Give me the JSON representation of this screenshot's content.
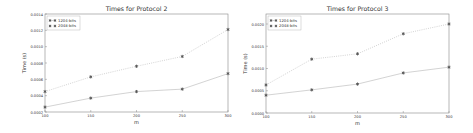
{
  "chart_data": [
    {
      "type": "line",
      "title": "Times for Protocol 2",
      "xlabel": "m",
      "ylabel": "Time (s)",
      "x": [
        100,
        150,
        200,
        250,
        300
      ],
      "xticks": [
        "100",
        "150",
        "200",
        "250",
        "300"
      ],
      "ylim": [
        0.0002,
        0.0014
      ],
      "yticks": [
        0.0002,
        0.0004,
        0.0006,
        0.0008,
        0.001,
        0.0012,
        0.0014
      ],
      "ytick_labels": [
        "0.0002",
        "0.0004",
        "0.0006",
        "0.0008",
        "0.0010",
        "0.0012",
        "0.0014"
      ],
      "grid": false,
      "legend_position": "upper left",
      "series": [
        {
          "name": "1204-bits",
          "style": "solid",
          "marker": "*",
          "values": [
            0.00026,
            0.00037,
            0.00045,
            0.00048,
            0.00067
          ]
        },
        {
          "name": "2048-bits",
          "style": "dotted",
          "marker": "*",
          "values": [
            0.00045,
            0.00063,
            0.00076,
            0.00088,
            0.00121
          ]
        }
      ]
    },
    {
      "type": "line",
      "title": "Times for Protocol 3",
      "xlabel": "m",
      "ylabel": "Time (s)",
      "x": [
        100,
        150,
        200,
        250,
        300
      ],
      "xticks": [
        "100",
        "150",
        "200",
        "250",
        "300"
      ],
      "ylim": [
        0.0,
        0.002
      ],
      "yticks": [
        0.0,
        0.0005,
        0.001,
        0.0015,
        0.002
      ],
      "ytick_labels": [
        "0.0000",
        "0.0005",
        "0.0010",
        "0.0015",
        "0.0020"
      ],
      "grid": false,
      "legend_position": "upper left",
      "series": [
        {
          "name": "1204-bits",
          "style": "solid",
          "marker": "*",
          "values": [
            0.0004,
            0.00052,
            0.00065,
            0.0009,
            0.00103
          ]
        },
        {
          "name": "2048-bits",
          "style": "dotted",
          "marker": "*",
          "values": [
            0.00063,
            0.00121,
            0.00133,
            0.00178,
            0.002
          ]
        }
      ]
    }
  ],
  "colors": {
    "line": "#c8c8c8",
    "marker": "#555555",
    "axis": "#888888",
    "text": "#333333"
  }
}
